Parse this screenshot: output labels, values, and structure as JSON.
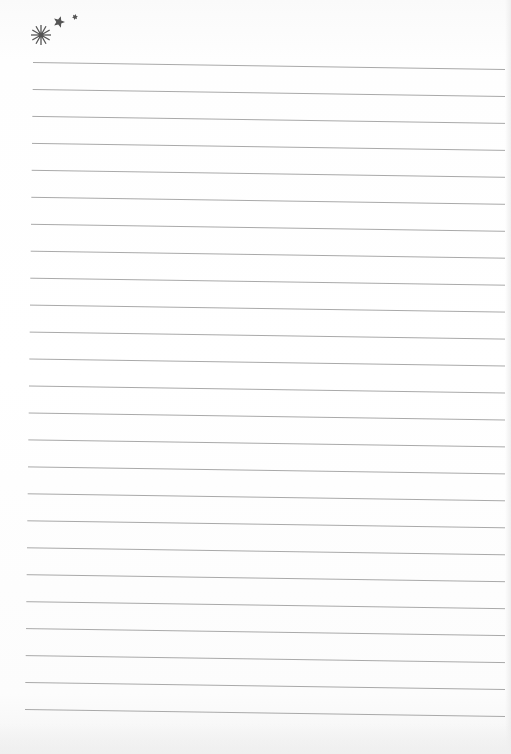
{
  "page": {
    "type": "lined-notebook-paper",
    "background_color": "#ffffff",
    "line_color": "#a9a9a9",
    "line_count": 25,
    "line_spacing_px": 27,
    "first_line_left": {
      "x": 33,
      "y": 62
    },
    "first_line_right": {
      "x": 505,
      "y": 69
    },
    "last_line_left": {
      "x": 25,
      "y": 709
    },
    "last_line_right": {
      "x": 505,
      "y": 716
    }
  },
  "decoration": {
    "color": "#555555",
    "icons": [
      {
        "name": "starburst-icon",
        "cx": 41,
        "cy": 35,
        "r": 10
      },
      {
        "name": "five-point-star-icon",
        "cx": 59,
        "cy": 22,
        "r": 6
      },
      {
        "name": "small-star-icon",
        "cx": 75,
        "cy": 17,
        "r": 3
      }
    ]
  }
}
